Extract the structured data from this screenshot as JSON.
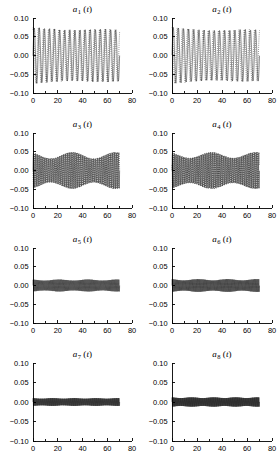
{
  "figure": {
    "type": "multi-panel-line-plot",
    "panel_count": 8,
    "layout": "4 rows x 2 columns",
    "background_color": "#ffffff",
    "line_color": "#000000"
  },
  "axes_common": {
    "xlabel": "",
    "ylabel": "",
    "xlim": [
      0,
      80
    ],
    "ylim": [
      -0.1,
      0.1
    ],
    "xticks": [
      0,
      20,
      40,
      60,
      80
    ],
    "xticklabels": [
      "0",
      "20",
      "40",
      "60",
      "80"
    ],
    "yticks": [
      -0.1,
      -0.05,
      0.0,
      0.05,
      0.1
    ],
    "yticklabels": [
      "-0.10",
      "-0.05",
      "0.00",
      "0.05",
      "0.10"
    ],
    "minor_xticks": [
      10,
      30,
      50,
      70
    ],
    "grid": false,
    "spines": [
      "left",
      "bottom"
    ],
    "data_x_end": 70
  },
  "chart_data": [
    {
      "type": "line",
      "title": "a_1(t)",
      "title_base": "a",
      "title_sub": "1",
      "title_arg": "(t)",
      "xlabel": "",
      "ylabel": "",
      "xlim": [
        0,
        80
      ],
      "ylim": [
        -0.1,
        0.1
      ],
      "amplitude": 0.075,
      "frequency_cycles": 17,
      "envelope_decay": 0.08,
      "beat_cycles": 1.0,
      "beat_depth": 0.07,
      "dotted_overlay": true,
      "overlay_phase_shift": 0.18,
      "description": "Large-amplitude regular oscillation, peak near 0.075, slight taper"
    },
    {
      "type": "line",
      "title": "a_2(t)",
      "title_base": "a",
      "title_sub": "2",
      "title_arg": "(t)",
      "xlabel": "",
      "ylabel": "",
      "xlim": [
        0,
        80
      ],
      "ylim": [
        -0.1,
        0.1
      ],
      "amplitude": 0.075,
      "frequency_cycles": 17,
      "envelope_decay": 0.1,
      "beat_cycles": 1.0,
      "beat_depth": 0.08,
      "dotted_overlay": true,
      "overlay_phase_shift": 0.22,
      "description": "Large-amplitude regular oscillation similar to a1, peak near 0.075"
    },
    {
      "type": "line",
      "title": "a_3(t)",
      "title_base": "a",
      "title_sub": "3",
      "title_arg": "(t)",
      "xlabel": "",
      "ylabel": "",
      "xlim": [
        0,
        80
      ],
      "ylim": [
        -0.1,
        0.1
      ],
      "amplitude": 0.048,
      "frequency_cycles": 46,
      "envelope_decay": 0.0,
      "beat_cycles": 2.0,
      "beat_depth": 0.35,
      "dotted_overlay": true,
      "overlay_phase_shift": 0.5,
      "description": "Dense oscillation bounded by dotted envelope near plus/minus 0.05"
    },
    {
      "type": "line",
      "title": "a_4(t)",
      "title_base": "a",
      "title_sub": "4",
      "title_arg": "(t)",
      "xlabel": "",
      "ylabel": "",
      "xlim": [
        0,
        80
      ],
      "ylim": [
        -0.1,
        0.1
      ],
      "amplitude": 0.048,
      "frequency_cycles": 48,
      "envelope_decay": 0.0,
      "beat_cycles": 2.0,
      "beat_depth": 0.32,
      "dotted_overlay": true,
      "overlay_phase_shift": 0.45,
      "description": "Dense oscillation bounded by dotted envelope near plus/minus 0.05"
    },
    {
      "type": "line",
      "title": "a_5(t)",
      "title_base": "a",
      "title_sub": "5",
      "title_arg": "(t)",
      "xlabel": "",
      "ylabel": "",
      "xlim": [
        0,
        80
      ],
      "ylim": [
        -0.1,
        0.1
      ],
      "amplitude": 0.016,
      "frequency_cycles": 95,
      "envelope_decay": 0.0,
      "beat_cycles": 3.0,
      "beat_depth": 0.18,
      "dotted_overlay": false,
      "overlay_phase_shift": 0.0,
      "description": "Narrow dense band of oscillation within plus/minus 0.016"
    },
    {
      "type": "line",
      "title": "a_6(t)",
      "title_base": "a",
      "title_sub": "6",
      "title_arg": "(t)",
      "xlabel": "",
      "ylabel": "",
      "xlim": [
        0,
        80
      ],
      "ylim": [
        -0.1,
        0.1
      ],
      "amplitude": 0.017,
      "frequency_cycles": 100,
      "envelope_decay": 0.0,
      "beat_cycles": 3.0,
      "beat_depth": 0.2,
      "dotted_overlay": false,
      "overlay_phase_shift": 0.0,
      "description": "Narrow dense band of oscillation within plus/minus 0.017"
    },
    {
      "type": "line",
      "title": "a_7(t)",
      "title_base": "a",
      "title_sub": "7",
      "title_arg": "(t)",
      "xlabel": "",
      "ylabel": "",
      "xlim": [
        0,
        80
      ],
      "ylim": [
        -0.1,
        0.1
      ],
      "amplitude": 0.01,
      "frequency_cycles": 130,
      "envelope_decay": 0.0,
      "beat_cycles": 4.0,
      "beat_depth": 0.15,
      "dotted_overlay": false,
      "overlay_phase_shift": 0.0,
      "description": "Very narrow dense band of oscillation within plus/minus 0.010"
    },
    {
      "type": "line",
      "title": "a_8(t)",
      "title_base": "a",
      "title_sub": "8",
      "title_arg": "(t)",
      "xlabel": "",
      "ylabel": "",
      "xlim": [
        0,
        80
      ],
      "ylim": [
        -0.1,
        0.1
      ],
      "amplitude": 0.012,
      "frequency_cycles": 135,
      "envelope_decay": 0.0,
      "beat_cycles": 4.0,
      "beat_depth": 0.16,
      "dotted_overlay": false,
      "overlay_phase_shift": 0.0,
      "description": "Very narrow dense band of oscillation within plus/minus 0.012"
    }
  ]
}
